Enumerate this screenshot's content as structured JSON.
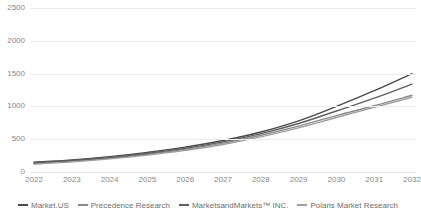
{
  "chart_data": {
    "type": "line",
    "title": "",
    "subtitle": "",
    "xlabel": "",
    "ylabel": "",
    "x": [
      "2022",
      "2023",
      "2024",
      "2025",
      "2026",
      "2027",
      "2028",
      "2029",
      "2030",
      "2031",
      "2032"
    ],
    "categories": [
      "2022",
      "2023",
      "2024",
      "2025",
      "2026",
      "2027",
      "2028",
      "2029",
      "2030",
      "2031",
      "2032"
    ],
    "ylim": [
      0,
      2500
    ],
    "yticks": [
      0,
      500,
      1000,
      1500,
      2000,
      2500
    ],
    "ytick_labels": [
      "0",
      "500",
      "1000",
      "1500",
      "2000",
      "2500"
    ],
    "grid": true,
    "legend_position": "bottom",
    "series": [
      {
        "name": "Market.US",
        "color": "#4a4a4a",
        "values": [
          150,
          185,
          235,
          300,
          380,
          480,
          610,
          780,
          1000,
          1240,
          1500
        ]
      },
      {
        "name": "Precedence Research",
        "color": "#8a8a8a",
        "values": [
          130,
          165,
          210,
          270,
          345,
          440,
          560,
          700,
          860,
          1010,
          1170
        ]
      },
      {
        "name": "MarketsandMarkets™ INC.",
        "color": "#5f5f5f",
        "values": [
          140,
          175,
          222,
          285,
          362,
          460,
          585,
          740,
          930,
          1125,
          1340
        ]
      },
      {
        "name": "Polaris Market Research",
        "color": "#9e9e9e",
        "values": [
          120,
          155,
          200,
          258,
          330,
          420,
          535,
          672,
          830,
          985,
          1140
        ]
      }
    ]
  },
  "legend": {
    "items": [
      {
        "label": "Market.US",
        "color": "#4a4a4a"
      },
      {
        "label": "Precedence Research",
        "color": "#8a8a8a"
      },
      {
        "label": "MarketsandMarkets™ INC.",
        "color": "#5f5f5f"
      },
      {
        "label": "Polaris Market Research",
        "color": "#9e9e9e"
      }
    ]
  },
  "colors": {
    "background": "#ffffff",
    "gridline": "#ececec",
    "axis_text": "#888888",
    "legend_text": "#6e6e6e"
  }
}
